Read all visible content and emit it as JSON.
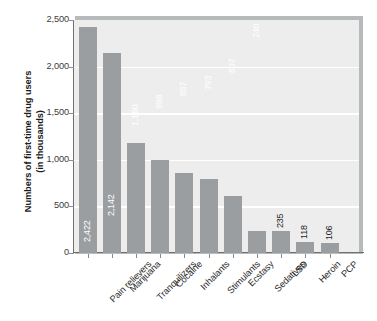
{
  "chart_data": {
    "type": "bar",
    "title": "",
    "xlabel": "",
    "ylabel": "Numbers of first-time drug users (in thousands)",
    "ylabel_line1": "Numbers of first-time drug users",
    "ylabel_line2": "(in thousands)",
    "ylim": [
      0,
      2500
    ],
    "yticks": [
      0,
      500,
      1000,
      1500,
      2000,
      2500
    ],
    "ytick_labels": [
      "0",
      "500",
      "1,000",
      "1,500",
      "2,000",
      "2,500"
    ],
    "grid": "horizontal-white-gridlines",
    "legend": "none",
    "categories": [
      "Pain relievers",
      "Marijuana",
      "Tranquilizers",
      "Cocaine",
      "Inhalants",
      "Stimulants",
      "Ecstasy",
      "Sedatives",
      "LSD",
      "Heroin",
      "PCP"
    ],
    "values": [
      2422,
      2142,
      1180,
      998,
      857,
      793,
      607,
      240,
      235,
      118,
      106
    ],
    "value_labels": [
      "2,422",
      "2,142",
      "1,180",
      "998",
      "857",
      "793",
      "607",
      "240",
      "235",
      "118",
      "106"
    ],
    "value_label_placement": [
      "inside",
      "inside",
      "inside",
      "inside",
      "inside",
      "inside",
      "inside",
      "inside",
      "outside",
      "outside",
      "outside"
    ],
    "colors": {
      "bar": "#9a9ea1",
      "plot_background": "#ededee",
      "plot_frame_shadow": "#b7babb",
      "gridline": "#ffffff",
      "axis": "#6f6f6f",
      "label_inside": "#ffffff",
      "label_outside": "#1f1f1f",
      "tick_text": "#3a3a3a",
      "axis_title": "#1c1c1c",
      "page_background": "#ffffff"
    }
  }
}
